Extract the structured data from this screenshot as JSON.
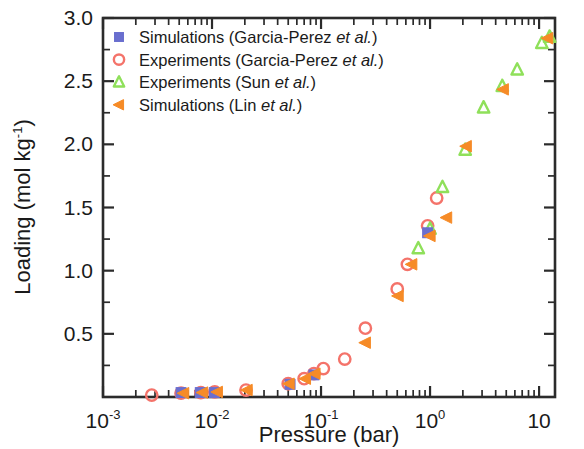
{
  "chart_data": {
    "type": "scatter",
    "title": "",
    "xlabel": "Pressure (bar)",
    "ylabel": "Loading (mol kg⁻¹)",
    "xscale": "log",
    "yscale": "linear",
    "xlim": [
      0.001,
      14
    ],
    "ylim": [
      0,
      3.0
    ],
    "grid": false,
    "legend_position": "top-left",
    "x_tick_labels": [
      "10⁻³",
      "10⁻²",
      "10⁻¹",
      "10⁰",
      "10"
    ],
    "x_tick_values": [
      0.001,
      0.01,
      0.1,
      1,
      10
    ],
    "y_tick_labels": [
      "0.5",
      "1.0",
      "1.5",
      "2.0",
      "2.5",
      "3.0"
    ],
    "y_tick_values": [
      0.5,
      1.0,
      1.5,
      2.0,
      2.5,
      3.0
    ],
    "series": [
      {
        "name": "Simulations (Garcia-Perez et al.)",
        "label_plain": "Simulations",
        "label_ref": "(Garcia-Perez ",
        "label_ital": "et al.",
        "label_tail": ")",
        "marker": "square-filled",
        "color": "#6a6fcf",
        "points": [
          [
            0.0052,
            0.035
          ],
          [
            0.0078,
            0.035
          ],
          [
            0.0105,
            0.035
          ],
          [
            0.052,
            0.1
          ],
          [
            0.086,
            0.175
          ],
          [
            0.95,
            1.3
          ]
        ]
      },
      {
        "name": "Experiments  (Garcia-Perez et al.)",
        "label_plain": "Experiments ",
        "label_ref": " (Garcia-Perez ",
        "label_ital": "et al.",
        "label_tail": ")",
        "marker": "circle-open",
        "color": "#f4736a",
        "points": [
          [
            0.0028,
            0.015
          ],
          [
            0.0052,
            0.03
          ],
          [
            0.0079,
            0.035
          ],
          [
            0.0106,
            0.04
          ],
          [
            0.0205,
            0.055
          ],
          [
            0.05,
            0.105
          ],
          [
            0.07,
            0.145
          ],
          [
            0.086,
            0.185
          ],
          [
            0.105,
            0.225
          ],
          [
            0.165,
            0.3
          ],
          [
            0.255,
            0.545
          ],
          [
            0.5,
            0.855
          ],
          [
            0.62,
            1.05
          ],
          [
            0.95,
            1.355
          ],
          [
            1.15,
            1.575
          ]
        ]
      },
      {
        "name": "Experiments (Sun et al.)",
        "label_plain": "Experiments ",
        "label_ref": "(Sun ",
        "label_ital": "et al.",
        "label_tail": ")",
        "marker": "triangle-up-open",
        "color": "#8fe05a",
        "points": [
          [
            0.78,
            1.175
          ],
          [
            1.0,
            1.33
          ],
          [
            1.3,
            1.66
          ],
          [
            2.1,
            1.955
          ],
          [
            3.1,
            2.29
          ],
          [
            4.6,
            2.46
          ],
          [
            6.3,
            2.59
          ],
          [
            10.6,
            2.8
          ],
          [
            12.5,
            2.85
          ]
        ]
      },
      {
        "name": "Simulations (Lin et al.)",
        "label_plain": "Simulations ",
        "label_ref": "(Lin ",
        "label_ital": "et al.",
        "label_tail": ")",
        "marker": "triangle-left-filled",
        "color": "#f68b27",
        "points": [
          [
            0.0055,
            0.03
          ],
          [
            0.0082,
            0.035
          ],
          [
            0.0112,
            0.04
          ],
          [
            0.021,
            0.055
          ],
          [
            0.051,
            0.105
          ],
          [
            0.072,
            0.145
          ],
          [
            0.088,
            0.185
          ],
          [
            0.255,
            0.43
          ],
          [
            0.51,
            0.8
          ],
          [
            0.68,
            1.05
          ],
          [
            1.0,
            1.275
          ],
          [
            1.42,
            1.42
          ],
          [
            2.15,
            1.985
          ],
          [
            4.7,
            2.435
          ],
          [
            12.0,
            2.84
          ]
        ]
      }
    ]
  },
  "legend": {
    "items": [
      {
        "marker": "square-filled",
        "color": "#6a6fcf",
        "pre": "Simulations (Garcia-Perez ",
        "ital": "et al.",
        "post": ")"
      },
      {
        "marker": "circle-open",
        "color": "#f4736a",
        "pre": "Experiments  (Garcia-Perez ",
        "ital": "et al.",
        "post": ")"
      },
      {
        "marker": "triangle-up-open",
        "color": "#8fe05a",
        "pre": "Experiments (Sun ",
        "ital": "et al.",
        "post": ")"
      },
      {
        "marker": "triangle-left-filled",
        "color": "#f68b27",
        "pre": "Simulations (Lin ",
        "ital": "et al.",
        "post": ")"
      }
    ]
  },
  "axes": {
    "x_title": "Pressure (bar)",
    "y_title_main": "Loading (mol kg",
    "y_title_sup": "-1",
    "y_title_close": ")"
  },
  "colors": {
    "axis": "#2b2b2b",
    "background": "#ffffff",
    "blue": "#6a6fcf",
    "red": "#f4736a",
    "green": "#8fe05a",
    "orange": "#f68b27"
  }
}
